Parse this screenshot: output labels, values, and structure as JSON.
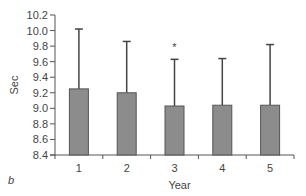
{
  "chart_data": {
    "type": "bar",
    "title": "",
    "panel_label": "b",
    "xlabel": "Year",
    "ylabel": "Sec",
    "categories": [
      "1",
      "2",
      "3",
      "4",
      "5"
    ],
    "values": [
      9.25,
      9.2,
      9.03,
      9.04,
      9.04
    ],
    "error_upper": [
      10.02,
      9.86,
      9.63,
      9.64,
      9.82
    ],
    "annotations": [
      {
        "category": "3",
        "text": "*"
      }
    ],
    "ylim": [
      8.4,
      10.2
    ],
    "yticks": [
      "8.4",
      "8.6",
      "8.8",
      "9.0",
      "9.2",
      "9.4",
      "9.6",
      "9.8",
      "10.0",
      "10.2"
    ],
    "grid": false,
    "bar_color": "#8c8c8c",
    "bar_edge_color": "#555555"
  }
}
